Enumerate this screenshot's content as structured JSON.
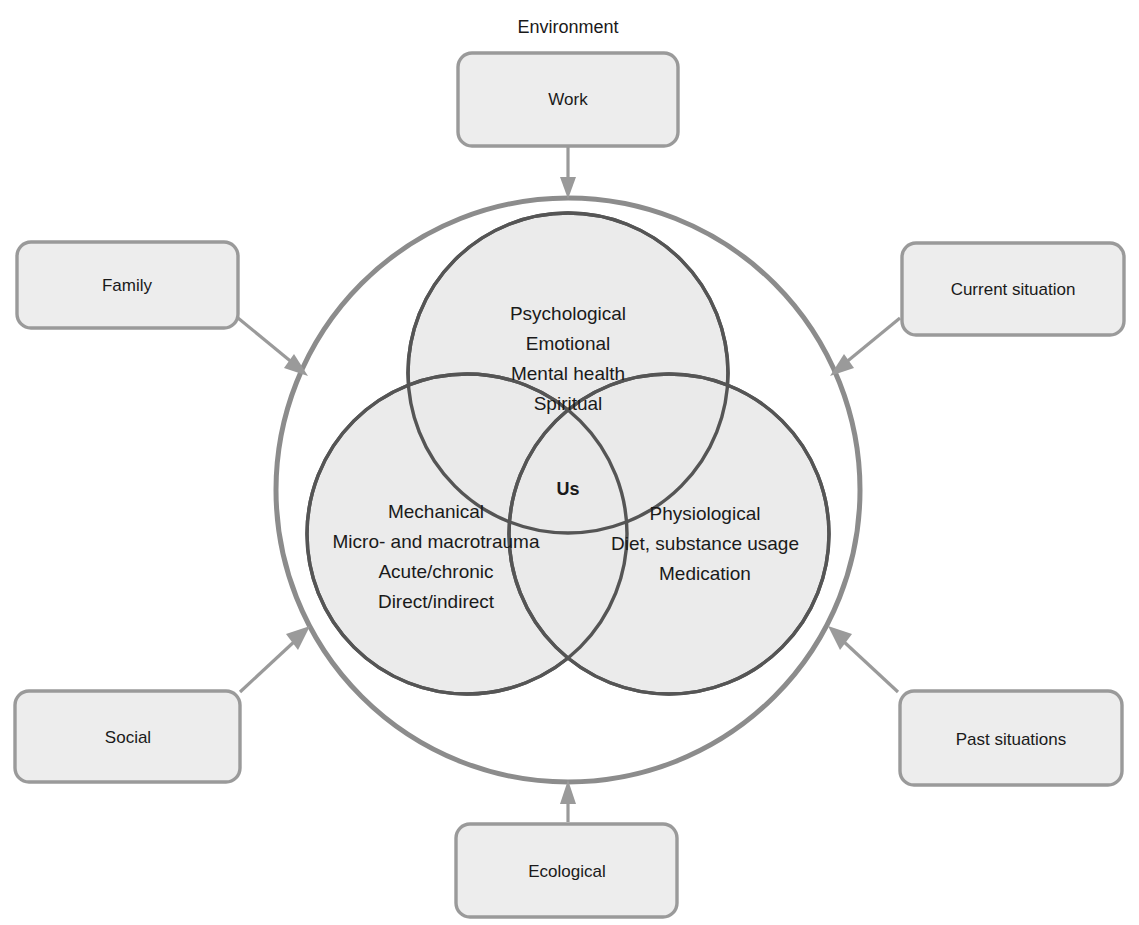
{
  "diagram": {
    "title": "Environment",
    "center_label": "Us",
    "environment_boxes": [
      {
        "id": "work",
        "label": "Work",
        "position": "top"
      },
      {
        "id": "family",
        "label": "Family",
        "position": "left-top"
      },
      {
        "id": "current-situation",
        "label": "Current situation",
        "position": "right-top"
      },
      {
        "id": "social",
        "label": "Social",
        "position": "left-bottom"
      },
      {
        "id": "past-situations",
        "label": "Past situations",
        "position": "right-bottom"
      },
      {
        "id": "ecological",
        "label": "Ecological",
        "position": "bottom"
      }
    ],
    "venn_circles": [
      {
        "id": "psychological",
        "position": "top",
        "lines": [
          "Psychological",
          "Emotional",
          "Mental health",
          "Spiritual"
        ]
      },
      {
        "id": "mechanical",
        "position": "bottom-left",
        "lines": [
          "Mechanical",
          "Micro- and macrotrauma",
          "Acute/chronic",
          "Direct/indirect"
        ]
      },
      {
        "id": "physiological",
        "position": "bottom-right",
        "lines": [
          "Physiological",
          "Diet, substance usage",
          "Medication"
        ]
      }
    ],
    "colors": {
      "circle_fill": "#e9e9e9",
      "circle_stroke": "#555555",
      "outer_ring_stroke": "#8c8c8c",
      "box_fill": "#ededed",
      "box_stroke": "#9a9a9a",
      "arrow": "#9a9a9a",
      "text": "#1a1a1a"
    }
  }
}
